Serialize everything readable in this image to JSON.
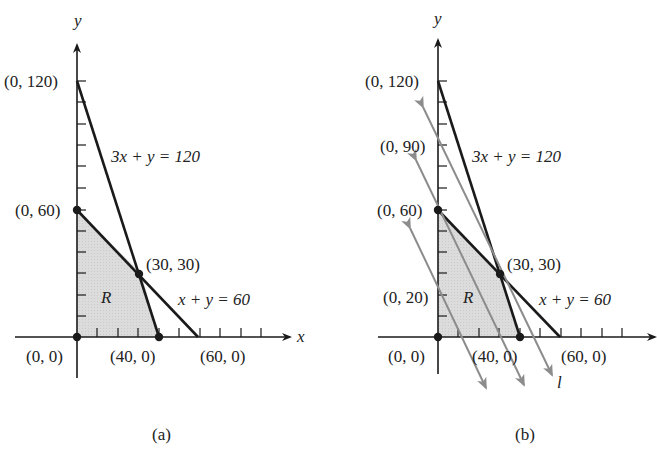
{
  "figure": {
    "panels": [
      {
        "id": "a",
        "caption": "(a)",
        "axis_x_label": "x",
        "axis_y_label": "y",
        "line1_label": "3x + y = 120",
        "line2_label": "x + y = 60",
        "region_label": "R",
        "points": {
          "p0_120": "(0, 120)",
          "p0_60": "(0, 60)",
          "p30_30": "(30, 30)",
          "p0_0": "(0, 0)",
          "p40_0": "(40, 0)",
          "p60_0": "(60, 0)"
        }
      },
      {
        "id": "b",
        "caption": "(b)",
        "axis_y_label": "y",
        "line1_label": "3x + y = 120",
        "line2_label": "x + y = 60",
        "region_label": "R",
        "objective_line_label": "l",
        "points": {
          "p0_120": "(0, 120)",
          "p0_90": "(0, 90)",
          "p0_60": "(0, 60)",
          "p0_20": "(0, 20)",
          "p30_30": "(30, 30)",
          "p0_0": "(0, 0)",
          "p40_0": "(40, 0)",
          "p60_0": "(60, 0)"
        }
      }
    ],
    "colors": {
      "line": "#1a1a1a",
      "region_fill": "#d9d9d9",
      "objective_lines": "#8c8c8c"
    }
  }
}
